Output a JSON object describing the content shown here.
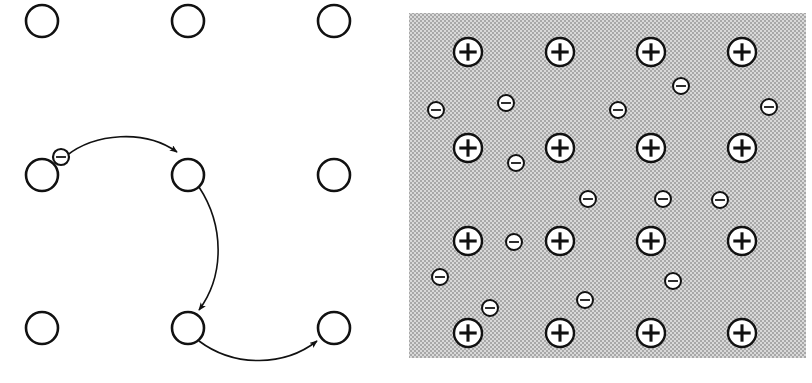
{
  "figure": {
    "title": "",
    "colors": {
      "stroke": "#111111",
      "fill_white": "#ffffff",
      "lattice_background_gray": "#c9c9c9",
      "stipple_dark": "#9a9a9a",
      "page_background": "#ffffff"
    },
    "panels": [
      {
        "id": "panel-left",
        "name": "conductor-lattice-outline",
        "description": "Open circles arranged in a lattice with one electron hopping along curved paths",
        "x": 0,
        "y": 0,
        "width": 406,
        "height": 383,
        "background": "#ffffff",
        "atom_radius": 16,
        "atoms": [
          {
            "label": "atom-r1c1",
            "cx": 42,
            "cy": 21
          },
          {
            "label": "atom-r1c2",
            "cx": 188,
            "cy": 21
          },
          {
            "label": "atom-r1c3",
            "cx": 334,
            "cy": 21
          },
          {
            "label": "atom-r2c1",
            "cx": 42,
            "cy": 175
          },
          {
            "label": "atom-r2c2",
            "cx": 188,
            "cy": 175
          },
          {
            "label": "atom-r2c3",
            "cx": 334,
            "cy": 175
          },
          {
            "label": "atom-r3c1",
            "cx": 42,
            "cy": 328
          },
          {
            "label": "atom-r3c2",
            "cx": 188,
            "cy": 328
          },
          {
            "label": "atom-r3c3",
            "cx": 334,
            "cy": 328
          }
        ],
        "electrons": [
          {
            "label": "hopping-electron",
            "cx": 61,
            "cy": 157,
            "r": 8,
            "sign": "minus"
          }
        ],
        "arrows": [
          {
            "label": "hop-path-1",
            "from_atom": "atom-r2c1",
            "to_atom": "atom-r2c2",
            "path": "M 66 156 C 95 133, 145 129, 177 152",
            "arrowhead_at": [
              177,
              152
            ]
          },
          {
            "label": "hop-path-2",
            "from_atom": "atom-r2c2",
            "to_atom": "atom-r3c2",
            "path": "M 199 187 C 224 225, 225 275, 199 310",
            "arrowhead_at": [
              199,
              310
            ]
          },
          {
            "label": "hop-path-3",
            "from_atom": "atom-r3c2",
            "to_atom": "atom-r3c3",
            "path": "M 199 341 C 235 368, 285 366, 317 341",
            "arrowhead_at": [
              317,
              341
            ]
          }
        ]
      },
      {
        "id": "panel-right",
        "name": "electron-sea-lattice",
        "description": "Grid of positive metal ions immersed in a stippled gray sea of delocalized electrons",
        "x": 406,
        "y": 0,
        "width": 406,
        "height": 383,
        "plate": {
          "x": 3,
          "y": 13,
          "width": 397,
          "height": 345
        },
        "ion_radius": 14,
        "ion_sign": "plus",
        "ions": [
          {
            "label": "ion-r1c1",
            "cx": 468,
            "cy": 52
          },
          {
            "label": "ion-r1c2",
            "cx": 560,
            "cy": 52
          },
          {
            "label": "ion-r1c3",
            "cx": 651,
            "cy": 52
          },
          {
            "label": "ion-r1c4",
            "cx": 742,
            "cy": 52
          },
          {
            "label": "ion-r2c1",
            "cx": 468,
            "cy": 148
          },
          {
            "label": "ion-r2c2",
            "cx": 560,
            "cy": 148
          },
          {
            "label": "ion-r2c3",
            "cx": 651,
            "cy": 148
          },
          {
            "label": "ion-r2c4",
            "cx": 742,
            "cy": 148
          },
          {
            "label": "ion-r3c1",
            "cx": 468,
            "cy": 241
          },
          {
            "label": "ion-r3c2",
            "cx": 560,
            "cy": 241
          },
          {
            "label": "ion-r3c3",
            "cx": 651,
            "cy": 241
          },
          {
            "label": "ion-r3c4",
            "cx": 742,
            "cy": 241
          },
          {
            "label": "ion-r4c1",
            "cx": 468,
            "cy": 333
          },
          {
            "label": "ion-r4c2",
            "cx": 560,
            "cy": 333
          },
          {
            "label": "ion-r4c3",
            "cx": 651,
            "cy": 333
          },
          {
            "label": "ion-r4c4",
            "cx": 742,
            "cy": 333
          }
        ],
        "electron_radius": 8,
        "electron_sign": "minus",
        "electrons": [
          {
            "label": "sea-electron-1",
            "cx": 436,
            "cy": 110
          },
          {
            "label": "sea-electron-2",
            "cx": 506,
            "cy": 103
          },
          {
            "label": "sea-electron-3",
            "cx": 618,
            "cy": 110
          },
          {
            "label": "sea-electron-4",
            "cx": 681,
            "cy": 86
          },
          {
            "label": "sea-electron-5",
            "cx": 769,
            "cy": 107
          },
          {
            "label": "sea-electron-6",
            "cx": 516,
            "cy": 163
          },
          {
            "label": "sea-electron-7",
            "cx": 588,
            "cy": 199
          },
          {
            "label": "sea-electron-8",
            "cx": 663,
            "cy": 199
          },
          {
            "label": "sea-electron-9",
            "cx": 720,
            "cy": 200
          },
          {
            "label": "sea-electron-10",
            "cx": 514,
            "cy": 242
          },
          {
            "label": "sea-electron-11",
            "cx": 440,
            "cy": 277
          },
          {
            "label": "sea-electron-12",
            "cx": 673,
            "cy": 281
          },
          {
            "label": "sea-electron-13",
            "cx": 490,
            "cy": 308
          },
          {
            "label": "sea-electron-14",
            "cx": 585,
            "cy": 300
          }
        ]
      }
    ]
  }
}
